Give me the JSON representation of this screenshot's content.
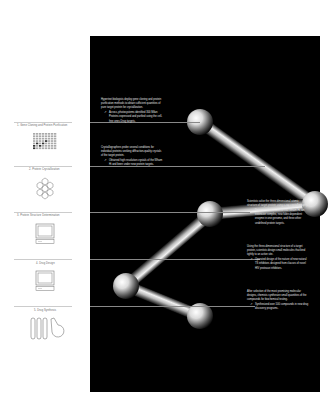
{
  "stages": [
    {
      "label": "1. Gene Cloning and Protein Purification",
      "icon": "protein-array-grid-icon",
      "note": "Hypertext biologists deploy gene cloning and protein purification methods to obtain sufficient quantities of pure target protein for crystallization.",
      "sub": "Across, photosystems identified 300 Milan Proteins expressed and purified using the cell-free ones Drug targets."
    },
    {
      "label": "2. Protein Crystallization",
      "icon": "crystal-cluster-icon",
      "note": "Crystallographers probe several conditions for individual proteins seeking diffraction-quality crystals of the target protein.",
      "sub": "Obtained high resolution crystals of the Wham Hi and been under new protein targets."
    },
    {
      "label": "3. Protein Structure Determination",
      "icon": "monitor-icon",
      "note": "Scientists solve the three-dimensional atomic structure of target protein using x-ray crystallography.",
      "sub": "Determined structures of 930 Wham Hi, an extensive complex, new fobin dependent enzyme in one genome, and three other undefined protein targets."
    },
    {
      "label": "4. Drug Design",
      "icon": "monitor-icon",
      "note": "Using the three-dimensional structure of a target protein, scientists design small molecules that bind tightly to an active site.",
      "sub": "Operated design of the nature of new natural TS inhibitors designed from classes of novel HIV protease inhibitors."
    },
    {
      "label": "5. Drug Synthesis",
      "icon": "test-tubes-flask-icon",
      "note": "After selection of the most promising molecular designs, chemists synthesize small quantities of the compounds for biochemical testing.",
      "sub": "Synthesized over 100 compounds in new drug discovery programs."
    }
  ],
  "colors": {
    "panel": "#000000",
    "page": "#ffffff",
    "note_text": "#e6e6e6",
    "label_text": "#666666"
  }
}
